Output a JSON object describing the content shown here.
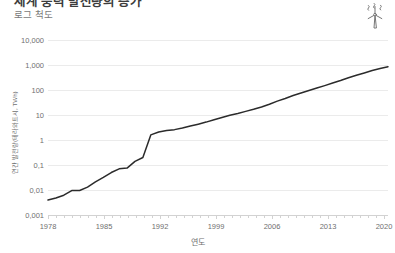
{
  "header": {
    "title": "세계 풍력 발전량의 증가",
    "subtitle": "로그 척도"
  },
  "icons": {
    "turbine": "wind-turbine-icon"
  },
  "colors": {
    "line": "#2b2b2b",
    "grid": "#e9e9e9",
    "axis": "#d7d7d7",
    "tick_text": "#6f6f6f",
    "title_text": "#3c3c3c",
    "background": "#ffffff"
  },
  "chart_data": {
    "type": "line",
    "title": "세계 풍력 발전량의 증가",
    "subtitle": "로그 척도",
    "xlabel": "연도",
    "ylabel": "연간 발전량(테라와트시, TWh)",
    "yscale": "log",
    "ylim": [
      0.001,
      10000
    ],
    "xlim": [
      1978,
      2021
    ],
    "grid": true,
    "legend": "none",
    "ytick_labels": [
      "10,000",
      "1,000",
      "100",
      "10",
      "1",
      "0,1",
      "0,01",
      "0,001"
    ],
    "ytick_values": [
      10000,
      1000,
      100,
      10,
      1,
      0.1,
      0.01,
      0.001
    ],
    "xtick_labels": [
      "1978",
      "1985",
      "1992",
      "1999",
      "2006",
      "2013",
      "2020"
    ],
    "xtick_values": [
      1978,
      1985,
      1992,
      1999,
      2006,
      2013,
      2020
    ],
    "series": [
      {
        "name": "연간 풍력 발전량",
        "x": [
          1978,
          1979,
          1980,
          1981,
          1982,
          1983,
          1984,
          1985,
          1986,
          1987,
          1988,
          1989,
          1990,
          1991,
          1992,
          1993,
          1994,
          1995,
          1996,
          1997,
          1998,
          1999,
          2000,
          2001,
          2002,
          2003,
          2004,
          2005,
          2006,
          2007,
          2008,
          2009,
          2010,
          2011,
          2012,
          2013,
          2014,
          2015,
          2016,
          2017,
          2018,
          2019,
          2020,
          2021
        ],
        "values": [
          0.004,
          0.0048,
          0.0062,
          0.0095,
          0.0095,
          0.013,
          0.021,
          0.032,
          0.05,
          0.07,
          0.075,
          0.14,
          0.2,
          1.6,
          2.1,
          2.4,
          2.6,
          3.0,
          3.6,
          4.3,
          5.2,
          6.5,
          8.0,
          9.8,
          11.5,
          14.0,
          17.0,
          21.0,
          27.0,
          36.0,
          46.0,
          60.0,
          76.0,
          96.0,
          120.0,
          150.0,
          190.0,
          240.0,
          310.0,
          390.0,
          480.0,
          600.0,
          720.0,
          850.0
        ]
      }
    ]
  },
  "axis_geometry": {
    "plot_left": 48,
    "plot_right": 388,
    "plot_top": 40,
    "plot_bottom": 215,
    "decade_px": 25
  }
}
